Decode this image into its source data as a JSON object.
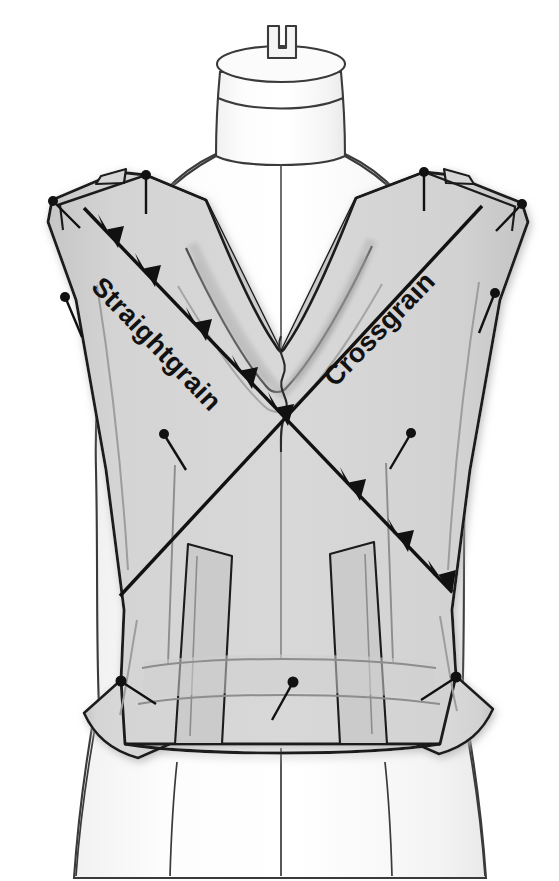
{
  "illustration": {
    "title": "Draped bodice on dress form with grainline markings",
    "subject": "dress-form-with-draped-bodice",
    "labels": {
      "straightgrain": "Straightgrain",
      "crossgrain": "Crossgrain"
    },
    "colors": {
      "background": "#ffffff",
      "fabric_fill": "#d2d2d2",
      "fabric_fill_light": "#dcdcdc",
      "fabric_shadow": "#b9b9b9",
      "outline": "#1a1a1a",
      "inner_line": "#8f8f8f",
      "form_outline": "#3a3a3a",
      "form_fill": "#ffffff",
      "pin_color": "#111111",
      "label_color": "#111111",
      "drop_shadow": "#cfcfcf"
    },
    "elements": {
      "dress_form": "dress-form",
      "neck_knob": "neck-knob",
      "draped_bodice": "draped-bodice",
      "cowl_neckline": "cowl-neckline",
      "waistband": "waistband",
      "side_flare_left": "left-side-flare",
      "side_flare_right": "right-side-flare",
      "straightgrain_arrow": "straightgrain-arrow-line",
      "crossgrain_arrow": "crossgrain-arrow-line",
      "skirt_lines": "dress-form-skirt-lines"
    },
    "pin_count": 11,
    "pins": [
      {
        "name": "pin-left-shoulder-outer",
        "x": 52,
        "y": 200,
        "angle": 50
      },
      {
        "name": "pin-left-shoulder-neck",
        "x": 146,
        "y": 175,
        "angle": 90
      },
      {
        "name": "pin-right-shoulder-neck",
        "x": 424,
        "y": 172,
        "angle": 90
      },
      {
        "name": "pin-right-shoulder-outer",
        "x": 522,
        "y": 203,
        "angle": 130
      },
      {
        "name": "pin-left-upper-bodice",
        "x": 65,
        "y": 297,
        "angle": 70
      },
      {
        "name": "pin-right-upper-bodice",
        "x": 495,
        "y": 293,
        "angle": 110
      },
      {
        "name": "pin-left-mid-bodice",
        "x": 164,
        "y": 434,
        "angle": 62
      },
      {
        "name": "pin-right-mid-bodice",
        "x": 411,
        "y": 433,
        "angle": 118
      },
      {
        "name": "pin-left-waist",
        "x": 121,
        "y": 680,
        "angle": 40
      },
      {
        "name": "pin-right-waist",
        "x": 456,
        "y": 676,
        "angle": 140
      },
      {
        "name": "pin-center-waist",
        "x": 293,
        "y": 682,
        "angle": 57
      }
    ]
  }
}
